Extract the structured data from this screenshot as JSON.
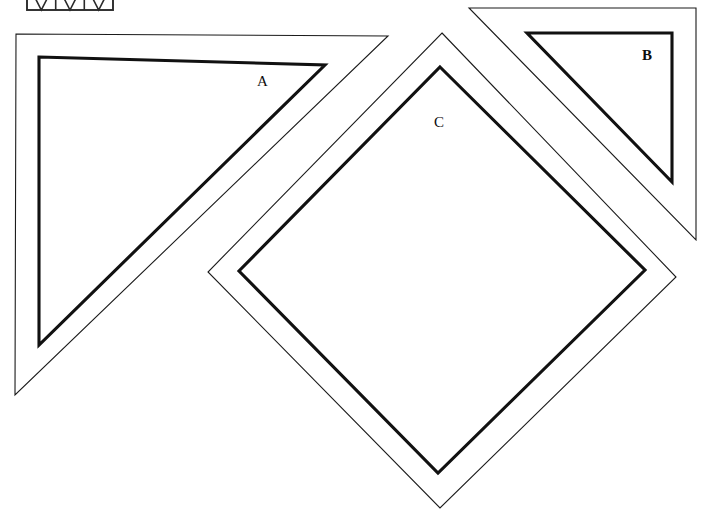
{
  "page": {
    "background_color": "#ffffff",
    "ink_color": "#111111",
    "width": 715,
    "height": 517
  },
  "figures": [
    {
      "id": "figure-a",
      "label": "A",
      "shape_name": "right-triangle",
      "description": "Right triangle with square corner at upper left, drawn as a thin outer outline with a thick inner outline offset inward",
      "label_position": {
        "x": 263,
        "y": 83
      },
      "outer_outline_points": "16,34 388,36 15,395",
      "inner_outline_points": "39,57 325,65 39,345",
      "outer_stroke_width": 1.1,
      "inner_stroke_width": 3.1
    },
    {
      "id": "figure-b",
      "label": "B",
      "shape_name": "right-triangle",
      "description": "Right triangle with square corner at upper right, cropped by the top edge of the page, drawn as a thin outer outline with a thick inner outline offset inward",
      "label_position": {
        "x": 648,
        "y": 57
      },
      "outer_outline_points": "469,8 696,8 696,240",
      "inner_outline_points": "527,33 672,33 672,182",
      "outer_stroke_width": 1.1,
      "inner_stroke_width": 3.1
    },
    {
      "id": "figure-c",
      "label": "C",
      "shape_name": "square-rotated-diamond",
      "description": "Square rotated 45 degrees into a diamond, drawn as a thin outer outline with a thick inner outline offset inward",
      "label_position": {
        "x": 440,
        "y": 124
      },
      "outer_outline_points": "442,33 676,277 440,508 208,272",
      "inner_outline_points": "440,67 645,270 438,473 239,271",
      "outer_stroke_width": 1.1,
      "inner_stroke_width": 3.1
    }
  ],
  "corner_figure": {
    "id": "truss-thumbnail",
    "shape_name": "truss-rectangle",
    "description": "Small rectangular truss diagram with diagonal cross bracing, cropped by the top edge of the page",
    "bounds": {
      "x": 27,
      "y": -18,
      "width": 86,
      "height": 28
    },
    "panel_count": 3,
    "visible_portion": "bottom"
  },
  "labels": {
    "a": "A",
    "b": "B",
    "c": "C"
  }
}
